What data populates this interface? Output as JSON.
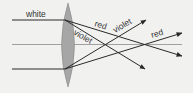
{
  "diagram": {
    "labels": {
      "incoming": "white",
      "top_red": "red",
      "bottom_violet": "violet",
      "top_violet": "violet",
      "bottom_red": "red"
    },
    "colors": {
      "background": "#f1f1f0",
      "lens_fill": "#a6a6a6",
      "lens_stroke": "#8a8a8a",
      "ray": "#2a2a2a",
      "axis": "#a0a0a0",
      "text": "#333333"
    }
  }
}
